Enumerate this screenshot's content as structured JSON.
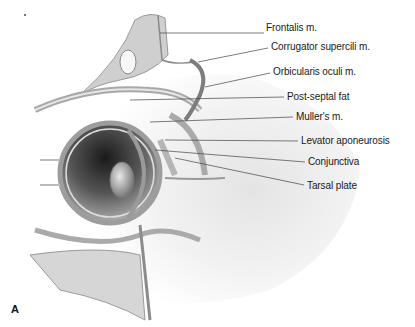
{
  "figure": {
    "panel_letter": "A",
    "labels": [
      {
        "text": "Frontalis m.",
        "x": 266,
        "y": 28
      },
      {
        "text": "Corrugator supercili m.",
        "x": 271,
        "y": 42
      },
      {
        "text": "Orbicularis oculi m.",
        "x": 273,
        "y": 67
      },
      {
        "text": "Post-septal fat",
        "x": 287,
        "y": 92
      },
      {
        "text": "Muller's m.",
        "x": 296,
        "y": 112
      },
      {
        "text": "Levator aponeurosis",
        "x": 301,
        "y": 136
      },
      {
        "text": "Conjunctiva",
        "x": 308,
        "y": 157
      },
      {
        "text": "Tarsal plate",
        "x": 307,
        "y": 182
      }
    ]
  }
}
